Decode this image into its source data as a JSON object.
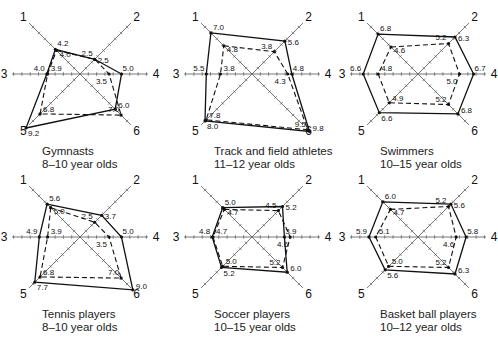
{
  "chart_data": [
    {
      "type": "radar",
      "title": "Gymnasts",
      "subtitle": "8–10 year olds",
      "axes": [
        "1",
        "2",
        "3",
        "4",
        "5",
        "6"
      ],
      "series": [
        {
          "name": "outer (solid)",
          "style": "solid",
          "values": [
            4.2,
            2.5,
            4.0,
            5.0,
            9.2,
            6.0
          ]
        },
        {
          "name": "inner (dashed)",
          "style": "dashed",
          "values": [
            4.0,
            2.5,
            3.9,
            3.5,
            6.8,
            7.0
          ]
        }
      ]
    },
    {
      "type": "radar",
      "title": "Track and field athletes",
      "subtitle": "11–12 year olds",
      "axes": [
        "1",
        "2",
        "3",
        "4",
        "5",
        "6"
      ],
      "series": [
        {
          "name": "outer (solid)",
          "style": "solid",
          "values": [
            7.0,
            5.6,
            5.5,
            4.8,
            8.0,
            9.8
          ]
        },
        {
          "name": "inner (dashed)",
          "style": "dashed",
          "values": [
            4.8,
            3.8,
            3.8,
            4.3,
            7.8,
            9.5
          ]
        }
      ]
    },
    {
      "type": "radar",
      "title": "Swimmers",
      "subtitle": "10–15 year olds",
      "axes": [
        "1",
        "2",
        "3",
        "4",
        "5",
        "6"
      ],
      "series": [
        {
          "name": "outer (solid)",
          "style": "solid",
          "values": [
            6.8,
            6.3,
            6.6,
            6.7,
            6.6,
            6.8
          ]
        },
        {
          "name": "inner (dashed)",
          "style": "dashed",
          "values": [
            4.6,
            5.2,
            4.8,
            5.0,
            4.9,
            5.2
          ]
        }
      ]
    },
    {
      "type": "radar",
      "title": "Tennis players",
      "subtitle": "8–10 year olds",
      "axes": [
        "1",
        "2",
        "3",
        "4",
        "5",
        "6"
      ],
      "series": [
        {
          "name": "outer (solid)",
          "style": "solid",
          "values": [
            5.6,
            3.7,
            4.9,
            5.0,
            7.7,
            9.0
          ]
        },
        {
          "name": "inner (dashed)",
          "style": "dashed",
          "values": [
            5.0,
            2.5,
            3.9,
            3.5,
            6.8,
            7.0
          ]
        }
      ]
    },
    {
      "type": "radar",
      "title": "Soccer players",
      "subtitle": "10–15 year olds",
      "axes": [
        "1",
        "2",
        "3",
        "4",
        "5",
        "6"
      ],
      "series": [
        {
          "name": "outer (solid)",
          "style": "solid",
          "values": [
            5.0,
            5.2,
            4.8,
            3.9,
            5.2,
            6.0
          ]
        },
        {
          "name": "inner (dashed)",
          "style": "dashed",
          "values": [
            4.7,
            4.5,
            4.7,
            4.6,
            5.0,
            5.2
          ]
        }
      ]
    },
    {
      "type": "radar",
      "title": "Basket ball players",
      "subtitle": "10–12 year olds",
      "axes": [
        "1",
        "2",
        "3",
        "4",
        "5",
        "6"
      ],
      "series": [
        {
          "name": "outer (solid)",
          "style": "solid",
          "values": [
            6.0,
            5.6,
            5.9,
            5.8,
            5.6,
            6.3
          ]
        },
        {
          "name": "inner (dashed)",
          "style": "dashed",
          "values": [
            4.7,
            5.2,
            5.1,
            4.6,
            5.0,
            5.2
          ]
        }
      ]
    }
  ],
  "layout": {
    "centers": [
      [
        80,
        74
      ],
      [
        252,
        74
      ],
      [
        418,
        74
      ],
      [
        80,
        237
      ],
      [
        252,
        237
      ],
      [
        418,
        237
      ]
    ],
    "px_per_unit": 8.3,
    "axis_length": 72,
    "tick_count": 8
  }
}
